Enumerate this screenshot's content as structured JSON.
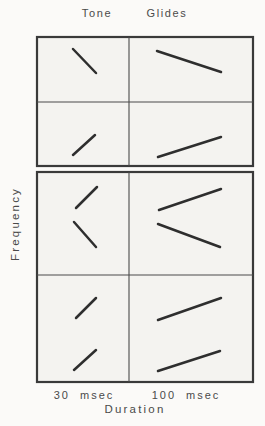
{
  "figure": {
    "title_left": "Tone",
    "title_right": "Glides",
    "y_axis_label": "Frequency",
    "x_axis_label": "Duration",
    "x_tick_left": "30 msec",
    "x_tick_right": "100 msec"
  },
  "colors": {
    "glide_stroke": "#2e2e2e",
    "frame_stroke": "#3a3a3a",
    "divider_stroke": "#4a4a4a",
    "panel_fill": "#f4f3f0",
    "page_background": "#fbfaf8",
    "text": "#4a4a4a"
  },
  "chart_data": {
    "type": "diagram",
    "title": "Tone Glides",
    "xlabel": "Duration",
    "ylabel": "Frequency",
    "x_categories": [
      "30 msec",
      "100 msec"
    ],
    "panels": [
      {
        "name": "single-glides",
        "frame": {
          "x": 37,
          "y": 37,
          "w": 216,
          "h": 129
        },
        "divider_x": 129,
        "divider_y": 102,
        "glides": [
          {
            "cell": "top-left",
            "duration": "30 msec",
            "direction": "falling",
            "x1": 73,
            "y1": 49,
            "x2": 96,
            "y2": 73
          },
          {
            "cell": "top-right",
            "duration": "100 msec",
            "direction": "falling",
            "x1": 157,
            "y1": 51,
            "x2": 221,
            "y2": 72
          },
          {
            "cell": "bottom-left",
            "duration": "30 msec",
            "direction": "rising",
            "x1": 73,
            "y1": 155,
            "x2": 95,
            "y2": 135
          },
          {
            "cell": "bottom-right",
            "duration": "100 msec",
            "direction": "rising",
            "x1": 158,
            "y1": 157,
            "x2": 221,
            "y2": 137
          }
        ]
      },
      {
        "name": "glide-pairs",
        "frame": {
          "x": 37,
          "y": 172,
          "w": 216,
          "h": 210
        },
        "divider_x": 129,
        "divider_y": 275,
        "glides": [
          {
            "cell": "top-left",
            "duration": "30 msec",
            "direction": "rising",
            "x1": 76,
            "y1": 208,
            "x2": 97,
            "y2": 187
          },
          {
            "cell": "top-left",
            "duration": "30 msec",
            "direction": "falling",
            "x1": 74,
            "y1": 222,
            "x2": 96,
            "y2": 247
          },
          {
            "cell": "top-right",
            "duration": "100 msec",
            "direction": "rising",
            "x1": 159,
            "y1": 210,
            "x2": 221,
            "y2": 189
          },
          {
            "cell": "top-right",
            "duration": "100 msec",
            "direction": "falling",
            "x1": 158,
            "y1": 224,
            "x2": 220,
            "y2": 247
          },
          {
            "cell": "bottom-left",
            "duration": "30 msec",
            "direction": "rising",
            "x1": 76,
            "y1": 318,
            "x2": 96,
            "y2": 298
          },
          {
            "cell": "bottom-left",
            "duration": "30 msec",
            "direction": "rising",
            "x1": 74,
            "y1": 370,
            "x2": 96,
            "y2": 350
          },
          {
            "cell": "bottom-right",
            "duration": "100 msec",
            "direction": "rising",
            "x1": 158,
            "y1": 320,
            "x2": 221,
            "y2": 298
          },
          {
            "cell": "bottom-right",
            "duration": "100 msec",
            "direction": "rising",
            "x1": 158,
            "y1": 371,
            "x2": 220,
            "y2": 351
          }
        ]
      }
    ]
  }
}
